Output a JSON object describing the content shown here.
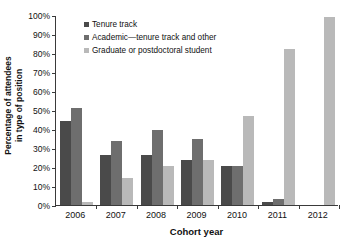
{
  "chart_data": {
    "type": "bar",
    "title": "",
    "xlabel": "Cohort year",
    "ylabel": "Percentage of attendees in type of position",
    "ylabel_line1": "Percentage of attendees",
    "ylabel_line2": "in type of position",
    "categories": [
      "2006",
      "2007",
      "2008",
      "2009",
      "2010",
      "2011",
      "2012"
    ],
    "ylim": [
      0,
      100
    ],
    "yticks": [
      "0%",
      "10%",
      "20%",
      "30%",
      "40%",
      "50%",
      "60%",
      "70%",
      "80%",
      "90%",
      "100%"
    ],
    "ytick_values": [
      0,
      10,
      20,
      30,
      40,
      50,
      60,
      70,
      80,
      90,
      100
    ],
    "grid": false,
    "legend_position": "upper-left-inside",
    "series": [
      {
        "name": "Tenure track",
        "color": "#4a4a4a",
        "values": [
          44,
          26.5,
          26.5,
          23.5,
          20.5,
          1.5,
          0
        ]
      },
      {
        "name": "Academic—tenure track and other",
        "color": "#6e6e6e",
        "values": [
          51,
          33.5,
          39.5,
          34.5,
          20.5,
          3,
          0
        ]
      },
      {
        "name": "Graduate or postdoctoral student",
        "color": "#b9b9b9",
        "values": [
          1.5,
          14,
          20.5,
          23.5,
          47,
          82,
          99
        ]
      }
    ]
  }
}
